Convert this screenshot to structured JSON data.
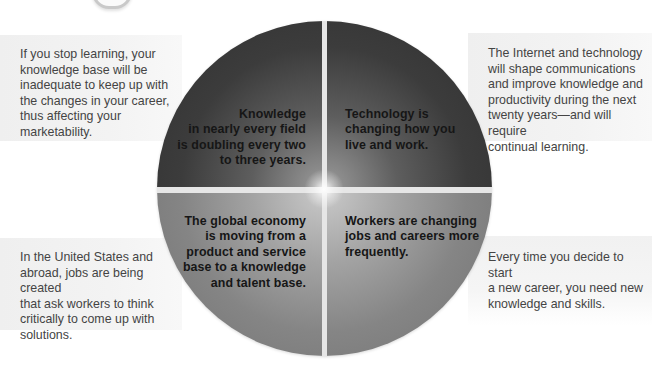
{
  "diagram": {
    "center_quadrants": [
      {
        "position": "top-left",
        "lines": [
          "Knowledge",
          "in nearly every field",
          "is doubling every two",
          "to three years."
        ]
      },
      {
        "position": "top-right",
        "lines": [
          "Technology is",
          "changing how you",
          "live and work."
        ]
      },
      {
        "position": "bottom-left",
        "lines": [
          "The global economy",
          "is moving from a",
          "product and service",
          "base to a knowledge",
          "and talent base."
        ]
      },
      {
        "position": "bottom-right",
        "lines": [
          "Workers are changing",
          "jobs and careers more",
          "frequently."
        ]
      }
    ],
    "notes": [
      {
        "position": "top-left",
        "lines": [
          "If you stop learning, your",
          "knowledge base will be",
          "inadequate to keep up with",
          "the changes in your career,",
          "thus affecting your",
          "marketability."
        ]
      },
      {
        "position": "top-right",
        "lines": [
          "The Internet and technology",
          "will shape communications",
          "and improve knowledge and",
          "productivity during the next",
          "twenty years—and will require",
          "continual learning."
        ]
      },
      {
        "position": "bottom-left",
        "lines": [
          "In the United States and",
          "abroad, jobs are being created",
          "that ask workers to think",
          "critically to come up with",
          "solutions."
        ]
      },
      {
        "position": "bottom-right",
        "lines": [
          "Every time you decide to start",
          "a new career, you need new",
          "knowledge and skills."
        ]
      }
    ],
    "colors": {
      "top_quadrants": "#333333",
      "bottom_quadrants": "#7a7a7a",
      "note_background": "#f1f1f1",
      "note_text": "#444444",
      "quadrant_text": "#161616"
    }
  }
}
